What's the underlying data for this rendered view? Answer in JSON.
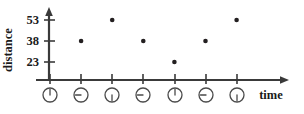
{
  "chart_data": {
    "type": "scatter",
    "title": "",
    "xlabel": "time",
    "ylabel": "distance",
    "grid": false,
    "legend": null,
    "ylim": [
      0,
      60
    ],
    "ytick_labels": [
      "23",
      "38",
      "53"
    ],
    "ytick_values": [
      23,
      38,
      53
    ],
    "xtick_labels": [
      "clock-12",
      "clock-9",
      "clock-6",
      "clock-9",
      "clock-12",
      "clock-9",
      "clock-6"
    ],
    "xtick_icons": [
      {
        "name": "clock-icon-12-oclock",
        "hand": "up"
      },
      {
        "name": "clock-icon-9-oclock",
        "hand": "left"
      },
      {
        "name": "clock-icon-6-oclock",
        "hand": "down"
      },
      {
        "name": "clock-icon-9-oclock",
        "hand": "left"
      },
      {
        "name": "clock-icon-12-oclock",
        "hand": "up"
      },
      {
        "name": "clock-icon-9-oclock",
        "hand": "left"
      },
      {
        "name": "clock-icon-6-oclock",
        "hand": "down"
      }
    ],
    "x": [
      2,
      3,
      4,
      5,
      6,
      7
    ],
    "values": [
      38,
      53,
      38,
      23,
      38,
      53
    ],
    "points": [
      {
        "x": 2,
        "y": 38
      },
      {
        "x": 3,
        "y": 53
      },
      {
        "x": 4,
        "y": 38
      },
      {
        "x": 5,
        "y": 23
      },
      {
        "x": 6,
        "y": 38
      },
      {
        "x": 7,
        "y": 53
      }
    ]
  },
  "labels": {
    "y_axis_title": "distance",
    "x_axis_title": "time",
    "y_tick_53": "53",
    "y_tick_38": "38",
    "y_tick_23": "23"
  }
}
